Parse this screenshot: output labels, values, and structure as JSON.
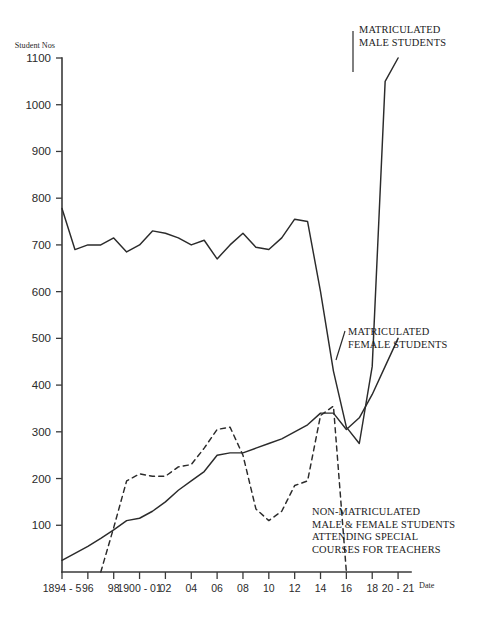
{
  "figure": {
    "y_axis_caption": "Student Nos",
    "x_axis_caption": "Date"
  },
  "annotations": {
    "male": "MATRICULATED\nMALE STUDENTS",
    "female": "MATRICULATED\nFEMALE STUDENTS",
    "nonmatric": "NON-MATRICULATED\nMALE & FEMALE STUDENTS\nATTENDING SPECIAL\nCOURSES FOR TEACHERS"
  },
  "chart_data": {
    "type": "line",
    "title": "",
    "xlabel": "Date",
    "ylabel": "Student Nos",
    "xlim": [
      1894,
      1921
    ],
    "ylim": [
      0,
      1100
    ],
    "grid": false,
    "legend": "annotations-inline",
    "ytick_labels": [
      "1100",
      "1000",
      "900",
      "800",
      "700",
      "600",
      "500",
      "400",
      "300",
      "200",
      "100"
    ],
    "ytick_values": [
      1100,
      1000,
      900,
      800,
      700,
      600,
      500,
      400,
      300,
      200,
      100
    ],
    "xtick_labels": [
      "1894 - 5",
      "96",
      "98",
      "1900 - 01",
      "02",
      "04",
      "06",
      "08",
      "10",
      "12",
      "14",
      "16",
      "18",
      "20 - 21"
    ],
    "xtick_values": [
      1894,
      1896,
      1898,
      1900,
      1902,
      1904,
      1906,
      1908,
      1910,
      1912,
      1914,
      1916,
      1918,
      1920
    ],
    "series": [
      {
        "name": "MATRICULATED MALE STUDENTS",
        "style": "solid",
        "x": [
          1894,
          1895,
          1896,
          1897,
          1898,
          1899,
          1900,
          1901,
          1902,
          1903,
          1904,
          1905,
          1906,
          1907,
          1908,
          1909,
          1910,
          1911,
          1912,
          1913,
          1914,
          1915,
          1916,
          1917,
          1918,
          1919,
          1920
        ],
        "values": [
          778,
          690,
          700,
          700,
          715,
          685,
          700,
          730,
          725,
          715,
          700,
          710,
          670,
          700,
          725,
          695,
          690,
          715,
          755,
          750,
          600,
          430,
          310,
          275,
          440,
          1050,
          1100
        ]
      },
      {
        "name": "MATRICULATED FEMALE STUDENTS",
        "style": "solid",
        "x": [
          1894,
          1895,
          1896,
          1897,
          1898,
          1899,
          1900,
          1901,
          1902,
          1903,
          1904,
          1905,
          1906,
          1907,
          1908,
          1909,
          1910,
          1911,
          1912,
          1913,
          1914,
          1915,
          1916,
          1917,
          1918,
          1919,
          1920
        ],
        "values": [
          25,
          40,
          55,
          72,
          90,
          110,
          115,
          130,
          150,
          175,
          195,
          215,
          250,
          255,
          255,
          265,
          275,
          285,
          300,
          315,
          340,
          340,
          305,
          330,
          380,
          440,
          500
        ]
      },
      {
        "name": "NON-MATRICULATED MALE & FEMALE STUDENTS ATTENDING SPECIAL COURSES FOR TEACHERS",
        "style": "dashed",
        "x": [
          1897,
          1898,
          1899,
          1900,
          1901,
          1902,
          1903,
          1904,
          1905,
          1906,
          1907,
          1908,
          1909,
          1910,
          1911,
          1912,
          1913,
          1914,
          1915,
          1916
        ],
        "values": [
          0,
          95,
          195,
          210,
          205,
          205,
          225,
          230,
          265,
          305,
          310,
          250,
          135,
          110,
          130,
          185,
          195,
          335,
          355,
          0
        ]
      }
    ]
  }
}
